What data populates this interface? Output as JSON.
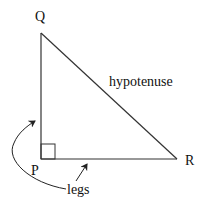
{
  "diagram": {
    "type": "right-triangle",
    "vertices": {
      "Q": {
        "label": "Q"
      },
      "P": {
        "label": "P"
      },
      "R": {
        "label": "R"
      }
    },
    "annotations": {
      "hypotenuse": "hypotenuse",
      "legs": "legs"
    },
    "right_angle_at": "P",
    "colors": {
      "stroke": "#333333",
      "text": "#111111",
      "background": "#ffffff"
    }
  }
}
